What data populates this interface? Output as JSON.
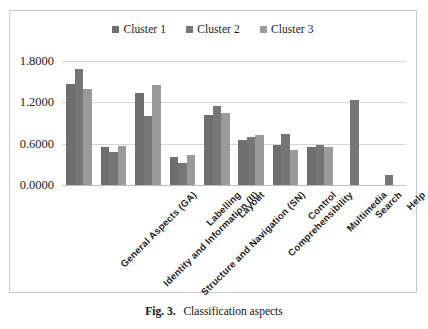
{
  "figure": {
    "caption_prefix": "Fig. 3.",
    "caption_text": "Classification aspects"
  },
  "legend": {
    "position": "top-center",
    "entries": [
      {
        "label": "Cluster 1",
        "color": "#6f6f6f"
      },
      {
        "label": "Cluster 2",
        "color": "#767676"
      },
      {
        "label": "Cluster 3",
        "color": "#9a9a9a"
      }
    ]
  },
  "chart_data": {
    "type": "bar",
    "title": "",
    "subtitle": "",
    "xlabel": "",
    "ylabel": "",
    "ylim": [
      0.0,
      1.8
    ],
    "yticks": [
      "0.0000",
      "0.6000",
      "1.2000",
      "1.8000"
    ],
    "ytick_values": [
      0.0,
      0.6,
      1.2,
      1.8
    ],
    "grid": true,
    "legend_position": "top-center",
    "categories": [
      "General Aspects (GA)",
      "Identity and Information (II)",
      "Structure and Navigation (SN)",
      "Labelling",
      "Layout",
      "Comprehensibility",
      "Control",
      "Multimedia",
      "Search",
      "Help"
    ],
    "series": [
      {
        "name": "Cluster 1",
        "color": "#6f6f6f",
        "values": [
          1.46,
          0.55,
          1.33,
          0.41,
          1.01,
          0.66,
          0.58,
          0.55,
          0.0,
          0.0
        ]
      },
      {
        "name": "Cluster 2",
        "color": "#767676",
        "values": [
          1.68,
          0.48,
          1.0,
          0.32,
          1.14,
          0.69,
          0.74,
          0.58,
          1.24,
          0.14
        ]
      },
      {
        "name": "Cluster 3",
        "color": "#9a9a9a",
        "values": [
          1.39,
          0.57,
          1.45,
          0.44,
          1.05,
          0.72,
          0.51,
          0.55,
          0.0,
          0.0
        ]
      }
    ]
  },
  "colors": {
    "frame_border": "#c9c9c9",
    "gridline": "#d4d4d4",
    "baseline": "#bdbdbd",
    "text": "#1a1a1a",
    "background": "#ffffff"
  }
}
